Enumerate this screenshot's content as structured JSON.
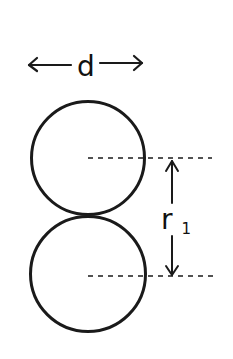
{
  "diagram": {
    "type": "geometry-sketch",
    "style": {
      "stroke_color": "#1a1a1a",
      "background": "#ffffff"
    },
    "diameter_annotation": {
      "label": "d",
      "arrow": "double-headed horizontal",
      "x_start": 28,
      "x_end": 143,
      "y": 64
    },
    "circles": [
      {
        "name": "top-circle",
        "cx": 88,
        "cy": 158,
        "r": 57
      },
      {
        "name": "bottom-circle",
        "cx": 88,
        "cy": 274,
        "r": 58
      }
    ],
    "center_lines": [
      {
        "name": "top-center-line",
        "x_start": 88,
        "x_end": 212,
        "y": 158,
        "style": "dashed"
      },
      {
        "name": "bottom-center-line",
        "x_start": 88,
        "x_end": 216,
        "y": 276,
        "style": "dashed"
      }
    ],
    "distance_annotation": {
      "label": "r",
      "subscript": "1",
      "arrow": "double-headed vertical",
      "x": 172,
      "y_start": 160,
      "y_end": 276
    }
  }
}
